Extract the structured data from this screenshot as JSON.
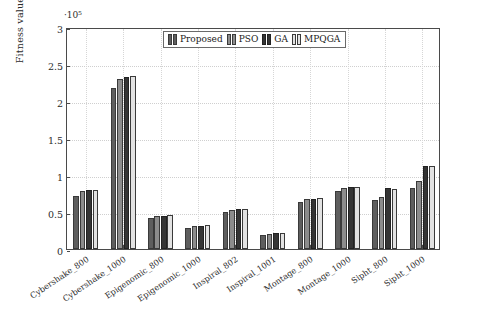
{
  "chart_data": {
    "type": "bar",
    "title": "",
    "xlabel": "",
    "ylabel": "Fitness value",
    "y_exponent_label": "·10⁵",
    "ylim": [
      0,
      3
    ],
    "y_ticks": [
      "0",
      "0.5",
      "1",
      "1.5",
      "2",
      "2.5",
      "3"
    ],
    "y_tick_values": [
      0,
      0.5,
      1,
      1.5,
      2,
      2.5,
      3
    ],
    "grid": true,
    "legend_position": "top-center",
    "categories": [
      "Cybershake_800",
      "Cybershake_1000",
      "Epigenomic_800",
      "Epigenomic_1000",
      "Inspiral_802",
      "Inspiral_1001",
      "Montage_800",
      "Montage_1000",
      "Sipht_800",
      "Sipht_1000"
    ],
    "series": [
      {
        "name": "Proposed",
        "color": "#5e5e5e",
        "values": [
          0.72,
          2.18,
          0.42,
          0.29,
          0.5,
          0.19,
          0.63,
          0.78,
          0.66,
          0.82
        ]
      },
      {
        "name": "PSO",
        "color": "#8c8c8c",
        "values": [
          0.79,
          2.3,
          0.45,
          0.31,
          0.53,
          0.2,
          0.68,
          0.83,
          0.7,
          0.92
        ]
      },
      {
        "name": "GA",
        "color": "#353535",
        "values": [
          0.8,
          2.33,
          0.44,
          0.31,
          0.54,
          0.21,
          0.68,
          0.84,
          0.82,
          1.12
        ]
      },
      {
        "name": "MPQGA",
        "color": "#e2e2e2",
        "values": [
          0.8,
          2.34,
          0.46,
          0.32,
          0.54,
          0.21,
          0.69,
          0.84,
          0.81,
          1.12
        ]
      }
    ]
  },
  "legend": {
    "entries": [
      "Proposed",
      "PSO",
      "GA",
      "MPQGA"
    ]
  }
}
